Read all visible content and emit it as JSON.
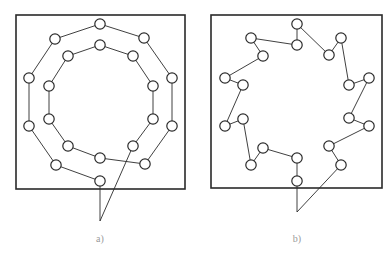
{
  "figure": {
    "stroke_color": "#2a2a2a",
    "panels": [
      {
        "id": "a",
        "label": "a)",
        "frame": {
          "x": 16,
          "y": 15,
          "w": 169,
          "h": 174
        },
        "nodes": [
          [
            100,
            181
          ],
          [
            56,
            165
          ],
          [
            29,
            126
          ],
          [
            29,
            78
          ],
          [
            55,
            39
          ],
          [
            100,
            24
          ],
          [
            144,
            38
          ],
          [
            172,
            78
          ],
          [
            172,
            126
          ],
          [
            145,
            164
          ],
          [
            100,
            158
          ],
          [
            68,
            146
          ],
          [
            49,
            119
          ],
          [
            49,
            86
          ],
          [
            68,
            56
          ],
          [
            100,
            45
          ],
          [
            133,
            56
          ],
          [
            153,
            86
          ],
          [
            153,
            119
          ],
          [
            133,
            146
          ]
        ],
        "path_order": [
          0,
          1,
          2,
          3,
          4,
          5,
          6,
          7,
          8,
          9,
          10,
          11,
          12,
          13,
          14,
          15,
          16,
          17,
          18,
          19
        ],
        "lead_point": [
          100,
          221
        ],
        "lead_from": [
          0,
          19
        ],
        "label_pos": [
          100,
          240
        ]
      },
      {
        "id": "b",
        "label": "b)",
        "frame": {
          "x": 211,
          "y": 15,
          "w": 171,
          "h": 173
        },
        "nodes": [
          [
            297,
            181
          ],
          [
            297,
            158
          ],
          [
            263,
            148
          ],
          [
            251,
            165
          ],
          [
            243,
            119
          ],
          [
            225,
            126
          ],
          [
            243,
            85
          ],
          [
            225,
            78
          ],
          [
            263,
            56
          ],
          [
            251,
            38
          ],
          [
            297,
            45
          ],
          [
            297,
            24
          ],
          [
            329,
            55
          ],
          [
            341,
            38
          ],
          [
            349,
            85
          ],
          [
            369,
            78
          ],
          [
            349,
            118
          ],
          [
            369,
            126
          ],
          [
            329,
            146
          ],
          [
            341,
            165
          ]
        ],
        "path_order": [
          0,
          1,
          2,
          3,
          4,
          5,
          6,
          7,
          8,
          9,
          10,
          11,
          12,
          13,
          14,
          15,
          16,
          17,
          18,
          19
        ],
        "lead_point": [
          297,
          212
        ],
        "lead_from": [
          0,
          19
        ],
        "label_pos": [
          297,
          240
        ]
      }
    ]
  }
}
